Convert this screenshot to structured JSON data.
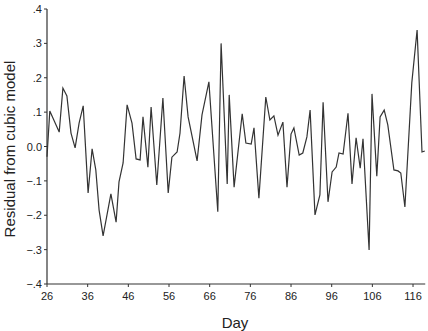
{
  "chart_data": {
    "type": "line",
    "title": "",
    "xlabel": "Day",
    "ylabel": "Residual from cubic model",
    "xlim": [
      26,
      119
    ],
    "ylim": [
      -0.4,
      0.4
    ],
    "x_ticks": [
      26,
      36,
      46,
      56,
      66,
      76,
      86,
      96,
      106,
      116
    ],
    "y_ticks": [
      {
        "value": 0.4,
        "label": ".4"
      },
      {
        "value": 0.3,
        "label": ".3"
      },
      {
        "value": 0.2,
        "label": ".2"
      },
      {
        "value": 0.1,
        "label": ".1"
      },
      {
        "value": 0.0,
        "label": "0.0"
      },
      {
        "value": -0.1,
        "label": "−.1"
      },
      {
        "value": -0.2,
        "label": "−.2"
      },
      {
        "value": -0.3,
        "label": "−.3"
      },
      {
        "value": -0.4,
        "label": "−.4"
      }
    ],
    "grid": false,
    "legend": null,
    "line_color": "#333333",
    "series": [
      {
        "name": "Residual",
        "x": [
          26.0,
          26.7,
          29.0,
          29.9,
          30.9,
          31.9,
          32.9,
          33.9,
          34.9,
          36.1,
          37.1,
          38.0,
          38.8,
          39.8,
          41.7,
          43.0,
          43.7,
          44.7,
          45.7,
          46.9,
          47.9,
          48.9,
          49.6,
          50.8,
          51.6,
          53.0,
          54.5,
          55.8,
          56.7,
          58.0,
          58.7,
          59.7,
          60.7,
          62.9,
          64.1,
          65.8,
          68.0,
          68.8,
          70.3,
          70.8,
          72.0,
          74.0,
          74.9,
          76.2,
          76.9,
          78.1,
          79.8,
          80.8,
          81.8,
          82.8,
          84.0,
          85.0,
          86.0,
          86.7,
          88.0,
          88.9,
          89.9,
          90.7,
          91.9,
          93.1,
          93.9,
          95.1,
          96.1,
          97.1,
          97.8,
          98.8,
          100.0,
          101.0,
          102.0,
          103.0,
          103.7,
          105.2,
          105.9,
          107.1,
          107.9,
          108.9,
          109.8,
          111.3,
          112.3,
          113.0,
          114.0,
          115.7,
          117.0,
          118.2,
          118.9
        ],
        "values": [
          -0.03,
          0.103,
          0.042,
          0.17,
          0.147,
          0.039,
          -0.004,
          0.068,
          0.118,
          -0.135,
          -0.007,
          -0.068,
          -0.185,
          -0.26,
          -0.138,
          -0.22,
          -0.103,
          -0.048,
          0.121,
          0.068,
          -0.036,
          -0.039,
          0.086,
          -0.06,
          0.115,
          -0.112,
          0.141,
          -0.135,
          -0.031,
          -0.016,
          0.039,
          0.205,
          0.086,
          -0.042,
          0.092,
          0.188,
          -0.19,
          0.3,
          -0.109,
          0.15,
          -0.118,
          0.095,
          0.01,
          0.007,
          0.054,
          -0.15,
          0.144,
          0.077,
          0.089,
          0.033,
          0.071,
          -0.118,
          0.036,
          0.054,
          -0.025,
          -0.019,
          0.028,
          0.106,
          -0.199,
          -0.141,
          0.129,
          -0.161,
          -0.074,
          -0.06,
          -0.019,
          -0.022,
          0.097,
          -0.109,
          0.025,
          -0.063,
          0.022,
          -0.301,
          0.153,
          -0.086,
          0.086,
          0.106,
          0.063,
          -0.068,
          -0.071,
          -0.077,
          -0.176,
          0.185,
          0.339,
          -0.016,
          -0.013
        ]
      }
    ]
  },
  "labels": {
    "ylabel": "Residual from cubic model",
    "xlabel": "Day"
  }
}
